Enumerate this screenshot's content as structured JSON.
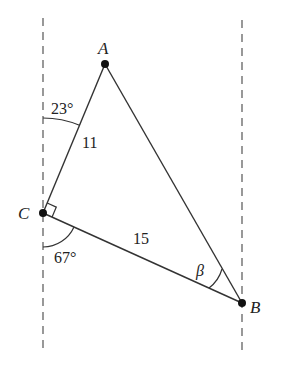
{
  "diagram": {
    "type": "geometry-triangle",
    "colors": {
      "stroke": "#333333",
      "dash": "#555555",
      "text": "#222222",
      "background": "#ffffff"
    },
    "points": {
      "A": {
        "label": "A",
        "x": 105,
        "y": 64
      },
      "B": {
        "label": "B",
        "x": 242,
        "y": 303
      },
      "C": {
        "label": "C",
        "x": 43,
        "y": 213
      }
    },
    "sides": {
      "AC": {
        "label": "11"
      },
      "CB": {
        "label": "15"
      }
    },
    "angles": {
      "upper_at_C": {
        "label": "23°"
      },
      "lower_at_C": {
        "label": "67°"
      },
      "at_B": {
        "label": "β"
      },
      "right_angle_at_C": true
    },
    "parallel_lines": [
      {
        "name": "left-dashed",
        "x": 43
      },
      {
        "name": "right-dashed",
        "x": 242
      }
    ]
  }
}
